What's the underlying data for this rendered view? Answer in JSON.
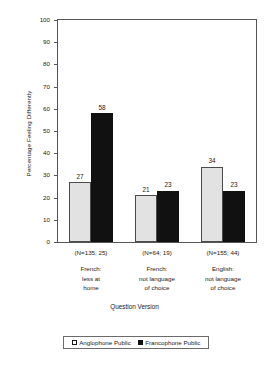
{
  "chart_data": {
    "type": "bar",
    "title": "",
    "xlabel": "Question Version",
    "ylabel": "Percentage Feeling Differently",
    "ylim": [
      0,
      100
    ],
    "ytick_step": 10,
    "yticks": [
      100,
      90,
      80,
      70,
      60,
      50,
      40,
      30,
      20,
      10,
      0
    ],
    "grid": false,
    "legend_position": "bottom",
    "categories": [
      "French: less at home",
      "French: not language of choice",
      "English: not language of choice"
    ],
    "category_labels": [
      {
        "n": "(N=135; 25)",
        "lines": [
          "French:",
          "less at",
          "home"
        ]
      },
      {
        "n": "(N=64; 19)",
        "lines": [
          "French:",
          "not language",
          "of choice"
        ]
      },
      {
        "n": "(N=155; 44)",
        "lines": [
          "English:",
          "not language",
          "of choice"
        ]
      }
    ],
    "series": [
      {
        "name": "Anglophone Public",
        "color": "#e2e2e2",
        "marker": "□",
        "values": [
          27,
          21,
          34
        ]
      },
      {
        "name": "Francophone Public",
        "color": "#111111",
        "marker": "■",
        "values": [
          58,
          23,
          23
        ]
      }
    ]
  },
  "legend": {
    "items": [
      {
        "marker": "□",
        "label": "Anglophone Public"
      },
      {
        "marker": "■",
        "label": "Francophone Public"
      }
    ]
  },
  "colors": {
    "anglophone": "#e2e2e2",
    "francophone": "#111111",
    "frame": "#555555",
    "text": "#1a1a1a"
  }
}
